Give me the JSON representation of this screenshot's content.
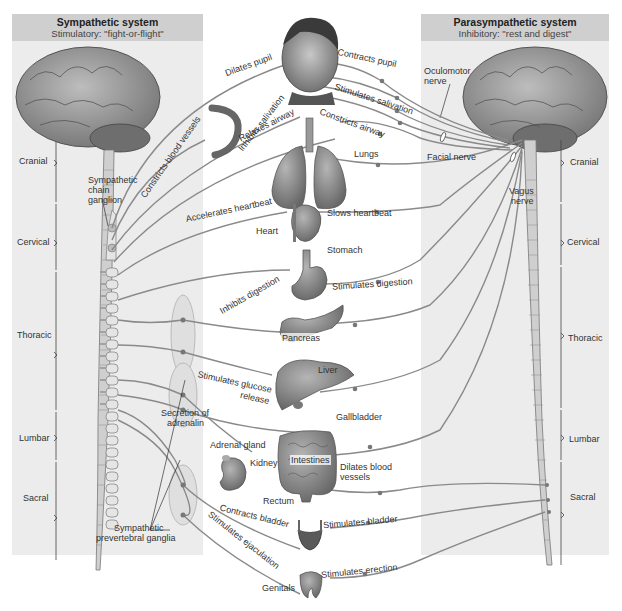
{
  "sympathetic": {
    "title": "Sympathetic system",
    "subtitle": "Stimulatory: \"fight-or-flight\"",
    "regions": [
      "Cranial",
      "Cervical",
      "Thoracic",
      "Lumbar",
      "Sacral"
    ],
    "chain_label": "Sympathetic chain ganglion",
    "ganglia_label": "Sympathetic prevertebral ganglia",
    "adrenalin_label": "Secretion of adrenalin",
    "actions": [
      "Dilates pupil",
      "Constricts blood vessels",
      "Inhibits salivation",
      "Relaxes airway",
      "Accelerates heartbeat",
      "Inhibits digestion",
      "Stimulates glucose release",
      "Contracts bladder",
      "Stimulates ejaculation"
    ]
  },
  "parasympathetic": {
    "title": "Parasympathetic system",
    "subtitle": "Inhibitory: \"rest and digest\"",
    "regions": [
      "Cranial",
      "Cervical",
      "Thoracic",
      "Lumbar",
      "Sacral"
    ],
    "nerves": [
      "Oculomotor nerve",
      "Facial nerve",
      "Vagus nerve"
    ],
    "actions": [
      "Contracts pupil",
      "Stimulates salivation",
      "Constricts airway",
      "Slows heartbeat",
      "Stimulates digestion",
      "Gallbladder",
      "Dilates blood vessels",
      "Stimulates bladder",
      "Stimulates erection"
    ]
  },
  "organs": {
    "lungs": "Lungs",
    "heart": "Heart",
    "stomach": "Stomach",
    "pancreas": "Pancreas",
    "liver": "Liver",
    "adrenal": "Adrenal gland",
    "kidney": "Kidney",
    "intestines": "Intestines",
    "rectum": "Rectum",
    "genitals": "Genitals"
  },
  "labels": {
    "oculomotor_1": "Oculomotor",
    "oculomotor_2": "nerve",
    "facial": "Facial nerve",
    "vagus_1": "Vagus",
    "vagus_2": "nerve",
    "chain_1": "Sympathetic",
    "chain_2": "chain",
    "chain_3": "ganglion",
    "adrenalin_1": "Secretion of",
    "adrenalin_2": "adrenalin",
    "ganglia_1": "Sympathetic",
    "ganglia_2": "prevertebral ganglia",
    "glucose_1": "Stimulates glucose",
    "glucose_2": "release",
    "dilates_1": "Dilates blood",
    "dilates_2": "vessels"
  },
  "colors": {
    "panel_bg": "#ececec",
    "header_bg": "#cfcfcf",
    "nerve": "#8a8a8a",
    "organ": "#8c8c8c",
    "spine": "#c9c9c9"
  }
}
